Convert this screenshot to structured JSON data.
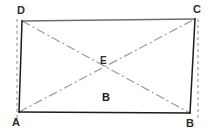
{
  "figure": {
    "canvas": {
      "width": 212,
      "height": 135,
      "background": "#ffffff"
    },
    "colors": {
      "outline_dark": "#1c1c1c",
      "outline_top": "#6e6e6e",
      "diagonal": "#9a9a9a",
      "guide_dashed": "#8c8c8c",
      "label_text": "#2b2b2b"
    },
    "vertices": [
      {
        "id": "A",
        "label": "A",
        "x": 19,
        "y": 112,
        "label_x": 12,
        "label_y": 117
      },
      {
        "id": "B",
        "label": "B",
        "x": 190,
        "y": 113,
        "label_x": 186,
        "label_y": 118
      },
      {
        "id": "C",
        "label": "C",
        "x": 195,
        "y": 19,
        "label_x": 193,
        "label_y": 4
      },
      {
        "id": "D",
        "label": "D",
        "x": 22,
        "y": 21,
        "label_x": 17,
        "label_y": 5
      }
    ],
    "center_point": {
      "id": "E",
      "label": "E",
      "x": 106,
      "y": 72,
      "label_x": 100,
      "label_y": 56
    },
    "interior_labels": [
      {
        "id": "region-B",
        "label": "B",
        "x": 102,
        "y": 92
      }
    ],
    "edges": [
      {
        "id": "edge-DC",
        "from": "D",
        "to": "C",
        "style": "solid",
        "color": "#6e6e6e",
        "width": 1.4
      },
      {
        "id": "edge-CB",
        "from": "C",
        "to": "B",
        "style": "solid",
        "color": "#1c1c1c",
        "width": 1.5
      },
      {
        "id": "edge-BA",
        "from": "B",
        "to": "A",
        "style": "solid",
        "color": "#1c1c1c",
        "width": 1.6
      },
      {
        "id": "edge-AD",
        "from": "A",
        "to": "D",
        "style": "solid",
        "color": "#1c1c1c",
        "width": 1.5
      }
    ],
    "diagonals": [
      {
        "id": "diagonal-AC",
        "from": "A",
        "to": "C",
        "style": "dash-dot",
        "color": "#9a9a9a",
        "width": 1.2
      },
      {
        "id": "diagonal-DB",
        "from": "D",
        "to": "B",
        "style": "dash-dot",
        "color": "#9a9a9a",
        "width": 1.2
      }
    ],
    "guide_lines": [
      {
        "id": "guide-left",
        "x1": 17,
        "y1": 19,
        "x2": 17,
        "y2": 120,
        "style": "dashed",
        "color": "#8c8c8c",
        "width": 1
      },
      {
        "id": "guide-right",
        "x1": 198,
        "y1": 19,
        "x2": 198,
        "y2": 120,
        "style": "dashed",
        "color": "#8c8c8c",
        "width": 1
      }
    ]
  }
}
